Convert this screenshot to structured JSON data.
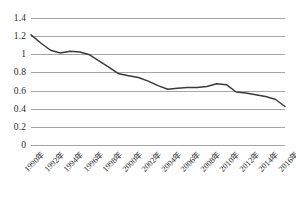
{
  "chart_data": {
    "type": "line",
    "title": "",
    "subtitle": "",
    "xlabel": "",
    "ylabel": "",
    "grid": true,
    "legend": false,
    "legend_position": "none",
    "line_color": "#3b3b3b",
    "grid_color": "#a6a6a6",
    "background_color": "#ffffff",
    "xlim": [
      1990,
      2016
    ],
    "ylim": [
      0,
      1.4
    ],
    "ytick_labels": [
      "1.4",
      "1.2",
      "1",
      "0.8",
      "0.6",
      "0.4",
      "0.2",
      "0"
    ],
    "ytick_values": [
      1.4,
      1.2,
      1.0,
      0.8,
      0.6,
      0.4,
      0.2,
      0
    ],
    "xtick_labels": [
      "1990年",
      "1992年",
      "1994年",
      "1996年",
      "1998年",
      "2000年",
      "2002年",
      "2004年",
      "2006年",
      "2008年",
      "2010年",
      "2012年",
      "2014年",
      "2016年"
    ],
    "xtick_values": [
      1990,
      1992,
      1994,
      1996,
      1998,
      2000,
      2002,
      2004,
      2006,
      2008,
      2010,
      2012,
      2014,
      2016
    ],
    "x": [
      1990,
      1991,
      1992,
      1993,
      1994,
      1995,
      1996,
      1997,
      1998,
      1999,
      2000,
      2001,
      2002,
      2003,
      2004,
      2005,
      2006,
      2007,
      2008,
      2009,
      2010,
      2011,
      2012,
      2013,
      2014,
      2015,
      2016
    ],
    "values": [
      1.22,
      1.13,
      1.05,
      1.02,
      1.04,
      1.03,
      1.0,
      0.93,
      0.86,
      0.79,
      0.77,
      0.75,
      0.71,
      0.66,
      0.62,
      0.63,
      0.64,
      0.64,
      0.65,
      0.68,
      0.67,
      0.59,
      0.58,
      0.56,
      0.54,
      0.51,
      0.43
    ],
    "series": [
      {
        "name": "",
        "values": [
          1.22,
          1.13,
          1.05,
          1.02,
          1.04,
          1.03,
          1.0,
          0.93,
          0.86,
          0.79,
          0.77,
          0.75,
          0.71,
          0.66,
          0.62,
          0.63,
          0.64,
          0.64,
          0.65,
          0.68,
          0.67,
          0.59,
          0.58,
          0.56,
          0.54,
          0.51,
          0.43
        ]
      }
    ]
  }
}
